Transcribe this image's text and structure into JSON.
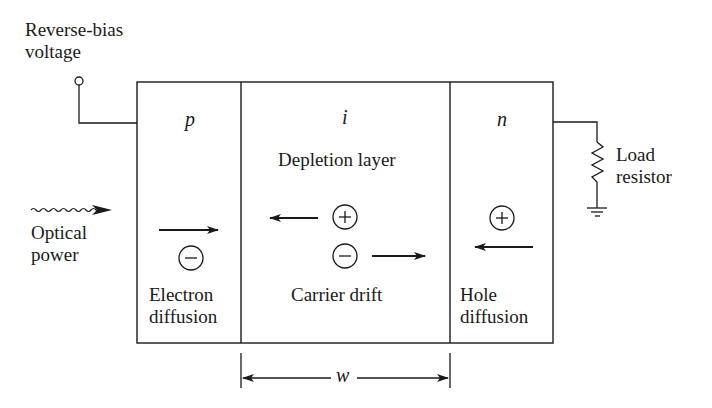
{
  "diagram": {
    "type": "pin-photodiode-schematic",
    "labels": {
      "bias_line1": "Reverse-bias",
      "bias_line2": "voltage",
      "optical_line1": "Optical",
      "optical_line2": "power",
      "load_line1": "Load",
      "load_line2": "resistor",
      "width_symbol": "w"
    },
    "regions": [
      {
        "symbol": "p",
        "caption_line1": "Electron",
        "caption_line2": "diffusion",
        "carrier": "−",
        "arrow": "right"
      },
      {
        "symbol": "i",
        "title": "Depletion layer",
        "caption": "Carrier drift",
        "carriers": [
          {
            "sign": "+",
            "arrow": "left"
          },
          {
            "sign": "−",
            "arrow": "right"
          }
        ]
      },
      {
        "symbol": "n",
        "caption_line1": "Hole",
        "caption_line2": "diffusion",
        "carrier": "+",
        "arrow": "left"
      }
    ],
    "colors": {
      "line": "#1a1a1a",
      "background": "#ffffff"
    }
  }
}
